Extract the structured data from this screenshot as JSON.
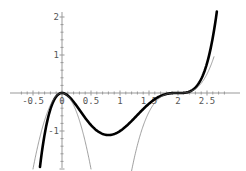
{
  "chart_data": {
    "type": "line",
    "title": "",
    "xlabel": "",
    "ylabel": "",
    "xlim": [
      -0.75,
      2.9
    ],
    "ylim": [
      -2.05,
      2.05
    ],
    "grid": false,
    "legend": null,
    "x_ticks": [
      "-0.5",
      "0.5",
      "1",
      "1.5",
      "2",
      "2.5"
    ],
    "y_ticks": [
      "2",
      "1",
      "-1"
    ],
    "series": [
      {
        "name": "f(x) = x^2 (x-2)^3",
        "style": "thick",
        "color": "#000000",
        "x": [
          -0.37,
          -0.2,
          0,
          0.4,
          0.8,
          1.2,
          1.6,
          2.0,
          2.3,
          2.5,
          2.67
        ],
        "y": [
          -1.99,
          -0.41,
          0,
          -0.7,
          -1.11,
          -0.74,
          -0.16,
          0,
          0.14,
          0.78,
          2.14
        ]
      },
      {
        "name": "local approx near 0: -8x^2",
        "style": "thin",
        "color": "#777777",
        "x": [
          -0.5,
          -0.25,
          0,
          0.25,
          0.5
        ],
        "y": [
          -2.0,
          -0.5,
          0,
          -0.5,
          -2.0
        ]
      },
      {
        "name": "local approx near 2: 4(x-2)^3",
        "style": "thin",
        "color": "#777777",
        "x": [
          1.2,
          1.5,
          1.8,
          2.0,
          2.2,
          2.5,
          2.62
        ],
        "y": [
          -2.05,
          -0.5,
          -0.03,
          0,
          0.03,
          0.5,
          0.95
        ]
      }
    ]
  }
}
